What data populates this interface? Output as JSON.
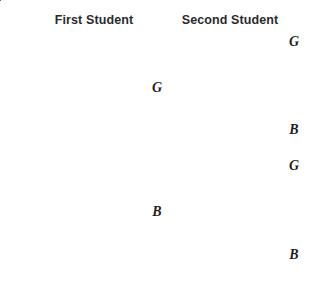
{
  "diagram": {
    "type": "probability-tree",
    "title": "",
    "headings": [
      {
        "id": "first",
        "label": "First Student"
      },
      {
        "id": "second",
        "label": "Second Student"
      }
    ],
    "line_color": "#4a4a4a",
    "text_color": "#2b2b2b",
    "background_color": "#ffffff",
    "root": {
      "label": "",
      "x": 20,
      "y": 151
    },
    "level1": [
      {
        "id": "first-g",
        "label": "G",
        "x": 157,
        "y": 88
      },
      {
        "id": "first-b",
        "label": "B",
        "x": 157,
        "y": 212
      }
    ],
    "level2": [
      {
        "id": "second-gg",
        "label": "G",
        "parent": "first-g",
        "x": 294,
        "y": 42
      },
      {
        "id": "second-gb",
        "label": "B",
        "parent": "first-g",
        "x": 294,
        "y": 130
      },
      {
        "id": "second-bg",
        "label": "G",
        "parent": "first-b",
        "x": 294,
        "y": 166
      },
      {
        "id": "second-bb",
        "label": "B",
        "parent": "first-b",
        "x": 294,
        "y": 255
      }
    ],
    "edges": [
      {
        "id": "root-to-first-g",
        "from": "root",
        "to": "first-g",
        "x1": 20,
        "y1": 151,
        "x2": 146,
        "y2": 89
      },
      {
        "id": "root-to-first-b",
        "from": "root",
        "to": "first-b",
        "x1": 20,
        "y1": 151,
        "x2": 146,
        "y2": 211
      },
      {
        "id": "first-g-to-gg",
        "from": "first-g",
        "to": "second-gg",
        "x1": 170,
        "y1": 88,
        "x2": 282,
        "y2": 42
      },
      {
        "id": "first-g-to-gb",
        "from": "first-g",
        "to": "second-gb",
        "x1": 170,
        "y1": 88,
        "x2": 283,
        "y2": 131
      },
      {
        "id": "first-b-to-bg",
        "from": "first-b",
        "to": "second-bg",
        "x1": 170,
        "y1": 212,
        "x2": 283,
        "y2": 166
      },
      {
        "id": "first-b-to-bb",
        "from": "first-b",
        "to": "second-bb",
        "x1": 170,
        "y1": 212,
        "x2": 283,
        "y2": 256
      }
    ]
  }
}
